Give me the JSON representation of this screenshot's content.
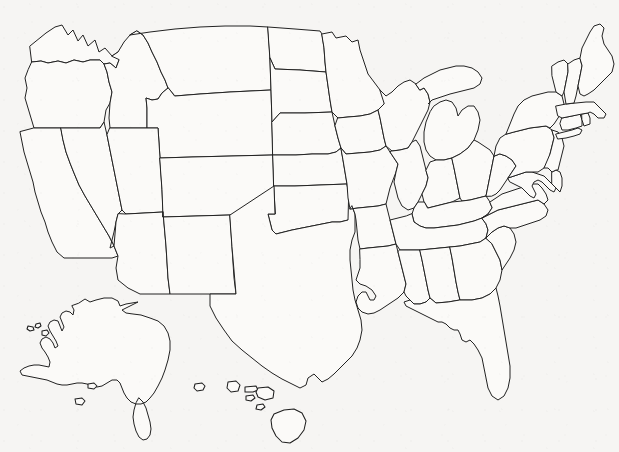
{
  "map": {
    "title": "Blank United States States Outline Map",
    "kind": "reference-outline-map",
    "labels_visible": false,
    "legend_visible": false,
    "border_frame_visible": false,
    "width_px": 619,
    "height_px": 452,
    "colors": {
      "background": "#f6f5f3",
      "land_fill": "#fbfaf8",
      "boundary_stroke": "#222222",
      "island_stroke": "#1d1d1d"
    },
    "stroke_width_px": 1,
    "projection_note": "contiguous 48 states with Alaska and Hawaii insets placed in the lower-left and lower-center",
    "regions": [
      {
        "name": "contiguous-united-states",
        "inset": false
      },
      {
        "name": "alaska",
        "inset": true
      },
      {
        "name": "hawaii",
        "inset": true
      }
    ],
    "state_outlines": [
      {
        "code": "WA",
        "name": "Washington"
      },
      {
        "code": "OR",
        "name": "Oregon"
      },
      {
        "code": "CA",
        "name": "California"
      },
      {
        "code": "NV",
        "name": "Nevada"
      },
      {
        "code": "ID",
        "name": "Idaho"
      },
      {
        "code": "MT",
        "name": "Montana"
      },
      {
        "code": "WY",
        "name": "Wyoming"
      },
      {
        "code": "UT",
        "name": "Utah"
      },
      {
        "code": "AZ",
        "name": "Arizona"
      },
      {
        "code": "CO",
        "name": "Colorado"
      },
      {
        "code": "NM",
        "name": "New Mexico"
      },
      {
        "code": "ND",
        "name": "North Dakota"
      },
      {
        "code": "SD",
        "name": "South Dakota"
      },
      {
        "code": "NE",
        "name": "Nebraska"
      },
      {
        "code": "KS",
        "name": "Kansas"
      },
      {
        "code": "OK",
        "name": "Oklahoma"
      },
      {
        "code": "TX",
        "name": "Texas"
      },
      {
        "code": "MN",
        "name": "Minnesota"
      },
      {
        "code": "IA",
        "name": "Iowa"
      },
      {
        "code": "MO",
        "name": "Missouri"
      },
      {
        "code": "AR",
        "name": "Arkansas"
      },
      {
        "code": "LA",
        "name": "Louisiana"
      },
      {
        "code": "WI",
        "name": "Wisconsin"
      },
      {
        "code": "IL",
        "name": "Illinois"
      },
      {
        "code": "MI",
        "name": "Michigan"
      },
      {
        "code": "IN",
        "name": "Indiana"
      },
      {
        "code": "OH",
        "name": "Ohio"
      },
      {
        "code": "KY",
        "name": "Kentucky"
      },
      {
        "code": "TN",
        "name": "Tennessee"
      },
      {
        "code": "MS",
        "name": "Mississippi"
      },
      {
        "code": "AL",
        "name": "Alabama"
      },
      {
        "code": "GA",
        "name": "Georgia"
      },
      {
        "code": "FL",
        "name": "Florida"
      },
      {
        "code": "SC",
        "name": "South Carolina"
      },
      {
        "code": "NC",
        "name": "North Carolina"
      },
      {
        "code": "VA",
        "name": "Virginia"
      },
      {
        "code": "WV",
        "name": "West Virginia"
      },
      {
        "code": "MD",
        "name": "Maryland"
      },
      {
        "code": "DE",
        "name": "Delaware"
      },
      {
        "code": "PA",
        "name": "Pennsylvania"
      },
      {
        "code": "NJ",
        "name": "New Jersey"
      },
      {
        "code": "NY",
        "name": "New York"
      },
      {
        "code": "CT",
        "name": "Connecticut"
      },
      {
        "code": "RI",
        "name": "Rhode Island"
      },
      {
        "code": "MA",
        "name": "Massachusetts"
      },
      {
        "code": "VT",
        "name": "Vermont"
      },
      {
        "code": "NH",
        "name": "New Hampshire"
      },
      {
        "code": "ME",
        "name": "Maine"
      },
      {
        "code": "AK",
        "name": "Alaska"
      },
      {
        "code": "HI",
        "name": "Hawaii"
      }
    ]
  }
}
